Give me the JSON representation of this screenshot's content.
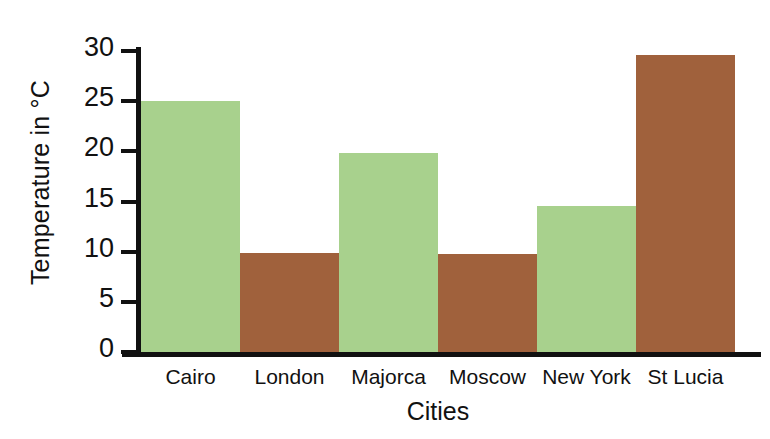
{
  "chart_data": {
    "type": "bar",
    "title": "",
    "subtitle": "",
    "xlabel": "Cities",
    "ylabel": "Temperature in °C",
    "categories": [
      "Cairo",
      "London",
      "Majorca",
      "Moscow",
      "New York",
      "St Lucia"
    ],
    "values": [
      25.0,
      9.9,
      19.8,
      9.8,
      14.6,
      29.6
    ],
    "bar_colors": [
      "#a8d18d",
      "#a0613c",
      "#a8d18d",
      "#a0613c",
      "#a8d18d",
      "#a0613c"
    ],
    "ylim": [
      0,
      30
    ],
    "yticks": [
      0,
      5,
      10,
      15,
      20,
      25,
      30
    ],
    "ytick_labels": [
      "0",
      "5",
      "10",
      "15",
      "20",
      "25",
      "30"
    ],
    "grid": false,
    "legend": null,
    "bar_gap": 0,
    "annotations": []
  },
  "axes": {
    "y_title": "Temperature in °C",
    "x_title": "Cities"
  },
  "palette": {
    "green": "#a8d18d",
    "brown": "#a0613c",
    "axis": "#111111",
    "background": "#ffffff"
  }
}
